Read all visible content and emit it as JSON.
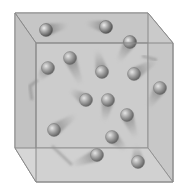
{
  "diagram": {
    "colors": {
      "background": "#ffffff",
      "box_fill": "#bdbdbd",
      "box_face": "#c8c8c8",
      "box_edge": "#8a8a8a",
      "ball_light": "#e6e6e6",
      "ball_dark": "#555555"
    },
    "box": {
      "back": [
        [
          15,
          13
        ],
        [
          148,
          13
        ],
        [
          148,
          148
        ],
        [
          15,
          148
        ]
      ],
      "front": [
        [
          36,
          43
        ],
        [
          173,
          43
        ],
        [
          173,
          182
        ],
        [
          36,
          182
        ]
      ]
    },
    "molecules": [
      {
        "x": 46,
        "y": 30,
        "tx": 68,
        "ty": 25
      },
      {
        "x": 106,
        "y": 27,
        "tx": 86,
        "ty": 23
      },
      {
        "x": 130,
        "y": 42,
        "tx": 118,
        "ty": 62
      },
      {
        "x": 70,
        "y": 58,
        "tx": 81,
        "ty": 85
      },
      {
        "x": 48,
        "y": 68,
        "tx": 38,
        "ty": 80
      },
      {
        "x": 102,
        "y": 72,
        "tx": 97,
        "ty": 50
      },
      {
        "x": 134,
        "y": 74,
        "tx": 157,
        "ty": 60
      },
      {
        "x": 160,
        "y": 88,
        "tx": 148,
        "ty": 108
      },
      {
        "x": 86,
        "y": 100,
        "tx": 70,
        "ty": 90
      },
      {
        "x": 108,
        "y": 100,
        "tx": 104,
        "ty": 122
      },
      {
        "x": 127,
        "y": 115,
        "tx": 136,
        "ty": 138
      },
      {
        "x": 54,
        "y": 130,
        "tx": 76,
        "ty": 115
      },
      {
        "x": 112,
        "y": 137,
        "tx": 126,
        "ty": 150
      },
      {
        "x": 97,
        "y": 155,
        "tx": 72,
        "ty": 165
      },
      {
        "x": 138,
        "y": 162,
        "tx": 136,
        "ty": 145
      }
    ],
    "bent_trails": [
      [
        [
          38,
          80
        ],
        [
          30,
          86
        ],
        [
          32,
          100
        ]
      ],
      [
        [
          72,
          165
        ],
        [
          52,
          146
        ]
      ],
      [
        [
          157,
          60
        ],
        [
          142,
          56
        ]
      ]
    ]
  }
}
